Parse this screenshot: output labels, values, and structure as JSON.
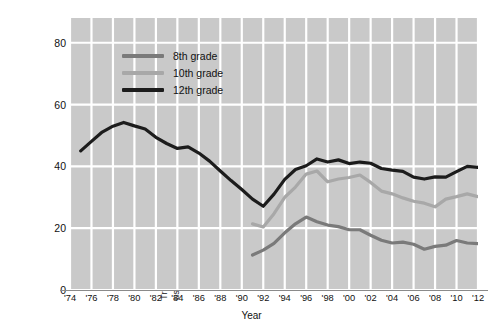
{
  "chart_data": {
    "type": "line",
    "title": "",
    "xlabel": "Year",
    "ylabel": "Trends in the percent of U.S. adolescents  who have used an illicit drug in the last 12 months",
    "ylabel_line1": "Trends in the percent of U.S. adolescents  who have",
    "ylabel_line2": "used an illicit drug in the last 12 months",
    "xlim": [
      1974,
      2012
    ],
    "ylim": [
      0,
      88
    ],
    "yticks": [
      0,
      20,
      40,
      60,
      80
    ],
    "ytick_labels": [
      "0",
      "20",
      "40",
      "60",
      "80"
    ],
    "xticks": [
      1974,
      1976,
      1978,
      1980,
      1982,
      1984,
      1986,
      1988,
      1990,
      1992,
      1994,
      1996,
      1998,
      2000,
      2002,
      2004,
      2006,
      2008,
      2010,
      2012
    ],
    "xtick_labels": [
      "'74",
      "'76",
      "'78",
      "'80",
      "'82",
      "'84",
      "'86",
      "'88",
      "'90",
      "'92",
      "'94",
      "'96",
      "'98",
      "'00",
      "'02",
      "'04",
      "'06",
      "'08",
      "'10",
      "'12"
    ],
    "grid": true,
    "grid_color": "#ffffff",
    "plot_background": "#c9c9c9",
    "legend_position": "upper-left-inside",
    "series": [
      {
        "name": "8th grade",
        "color": "#7a7a7a",
        "x": [
          1991,
          1992,
          1993,
          1994,
          1995,
          1996,
          1997,
          1998,
          1999,
          2000,
          2001,
          2002,
          2003,
          2004,
          2005,
          2006,
          2007,
          2008,
          2009,
          2010,
          2011,
          2012
        ],
        "values": [
          11.3,
          12.9,
          15.1,
          18.5,
          21.4,
          23.6,
          22.1,
          21.0,
          20.5,
          19.5,
          19.5,
          17.7,
          16.1,
          15.2,
          15.5,
          14.8,
          13.2,
          14.1,
          14.5,
          16.0,
          15.2,
          15.0
        ]
      },
      {
        "name": "10th grade",
        "color": "#a8a8a8",
        "x": [
          1991,
          1992,
          1993,
          1994,
          1995,
          1996,
          1997,
          1998,
          1999,
          2000,
          2001,
          2002,
          2003,
          2004,
          2005,
          2006,
          2007,
          2008,
          2009,
          2010,
          2011,
          2012
        ],
        "values": [
          21.4,
          20.4,
          24.7,
          30.0,
          33.3,
          37.5,
          38.5,
          35.0,
          35.9,
          36.4,
          37.2,
          34.8,
          32.0,
          31.1,
          29.8,
          28.7,
          28.1,
          26.9,
          29.4,
          30.2,
          31.1,
          30.2
        ]
      },
      {
        "name": "12th grade",
        "color": "#1c1c1c",
        "x": [
          1975,
          1976,
          1977,
          1978,
          1979,
          1980,
          1981,
          1982,
          1983,
          1984,
          1985,
          1986,
          1987,
          1988,
          1989,
          1990,
          1991,
          1992,
          1993,
          1994,
          1995,
          1996,
          1997,
          1998,
          1999,
          2000,
          2001,
          2002,
          2003,
          2004,
          2005,
          2006,
          2007,
          2008,
          2009,
          2010,
          2011,
          2012
        ],
        "values": [
          45.0,
          48.1,
          51.1,
          53.0,
          54.2,
          53.1,
          52.1,
          49.4,
          47.4,
          45.8,
          46.3,
          44.3,
          41.7,
          38.5,
          35.4,
          32.5,
          29.4,
          27.1,
          31.0,
          35.8,
          39.0,
          40.2,
          42.4,
          41.4,
          42.1,
          40.9,
          41.4,
          41.0,
          39.3,
          38.8,
          38.4,
          36.5,
          35.9,
          36.6,
          36.5,
          38.3,
          40.0,
          39.7
        ]
      }
    ]
  },
  "legend": {
    "items": [
      {
        "label": "8th grade",
        "color": "#7a7a7a"
      },
      {
        "label": "10th grade",
        "color": "#a8a8a8"
      },
      {
        "label": "12th grade",
        "color": "#1c1c1c"
      }
    ]
  },
  "axes": {
    "x_title": "Year",
    "y_title_line1": "Trends in the percent of U.S. adolescents  who have",
    "y_title_line2": "used an illicit drug in the last 12 months"
  }
}
